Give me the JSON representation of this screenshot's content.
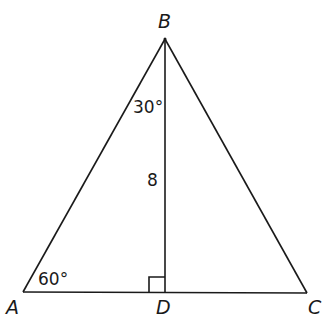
{
  "diagram": {
    "type": "triangle",
    "vertices": {
      "A": {
        "label": "A",
        "x": 23,
        "y": 292
      },
      "B": {
        "label": "B",
        "x": 165,
        "y": 39
      },
      "C": {
        "label": "C",
        "x": 307,
        "y": 293
      },
      "D": {
        "label": "D",
        "x": 165,
        "y": 293
      }
    },
    "segments": [
      {
        "from": "A",
        "to": "B"
      },
      {
        "from": "B",
        "to": "C"
      },
      {
        "from": "A",
        "to": "C"
      },
      {
        "from": "B",
        "to": "D"
      }
    ],
    "angles": {
      "ABD": "30°",
      "BAD": "60°"
    },
    "lengths": {
      "BD": "8"
    },
    "right_angle_at": "D",
    "stroke_color": "#1a1a1a"
  }
}
